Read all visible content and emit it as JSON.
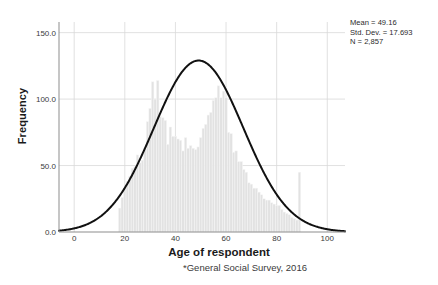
{
  "chart_data": {
    "type": "bar",
    "title": "",
    "xlabel": "Age of respondent",
    "ylabel": "Frequency",
    "footnote": "*General Social Survey, 2016",
    "xlim": [
      -6,
      107
    ],
    "ylim": [
      0,
      158
    ],
    "xticks": [
      0,
      20,
      40,
      60,
      80,
      100
    ],
    "xtick_labels": [
      "0",
      "20",
      "40",
      "60",
      "80",
      "100"
    ],
    "yticks": [
      0,
      50,
      100,
      150
    ],
    "ytick_labels": [
      "0.0",
      "50.0",
      "100.0",
      "150.0"
    ],
    "grid": true,
    "bar_color": "#e2e2e2",
    "bar_edge_color": "#f6f6f6",
    "curve_color": "#111111",
    "bin_width": 1,
    "categories": [
      18,
      19,
      20,
      21,
      22,
      23,
      24,
      25,
      26,
      27,
      28,
      29,
      30,
      31,
      32,
      33,
      34,
      35,
      36,
      37,
      38,
      39,
      40,
      41,
      42,
      43,
      44,
      45,
      46,
      47,
      48,
      49,
      50,
      51,
      52,
      53,
      54,
      55,
      56,
      57,
      58,
      59,
      60,
      61,
      62,
      63,
      64,
      65,
      66,
      67,
      68,
      69,
      70,
      71,
      72,
      73,
      74,
      75,
      76,
      77,
      78,
      79,
      80,
      81,
      82,
      83,
      84,
      85,
      86,
      87,
      88,
      89
    ],
    "values": [
      18,
      26,
      33,
      38,
      42,
      48,
      49,
      58,
      52,
      54,
      63,
      83,
      93,
      113,
      100,
      114,
      87,
      86,
      84,
      66,
      79,
      72,
      72,
      70,
      69,
      61,
      71,
      63,
      65,
      63,
      62,
      64,
      71,
      78,
      81,
      88,
      90,
      99,
      101,
      110,
      101,
      106,
      101,
      75,
      74,
      60,
      61,
      53,
      53,
      47,
      45,
      37,
      36,
      33,
      33,
      30,
      28,
      25,
      24,
      24,
      22,
      21,
      20,
      20,
      17,
      15,
      14,
      13,
      11,
      10,
      9,
      45
    ],
    "normal_curve": {
      "mean": 49.16,
      "std_dev": 17.693,
      "n": 2857,
      "peak_frequency": 129,
      "color": "#111111",
      "line_width": 2.0
    },
    "annotations": {
      "mean_label": "Mean = 49.16",
      "std_label": "Std. Dev. = 17.693",
      "n_label": "N = 2,857"
    }
  },
  "axes": {
    "ylabel": "Frequency",
    "xlabel": "Age of respondent"
  },
  "footnote": "*General Social Survey, 2016"
}
